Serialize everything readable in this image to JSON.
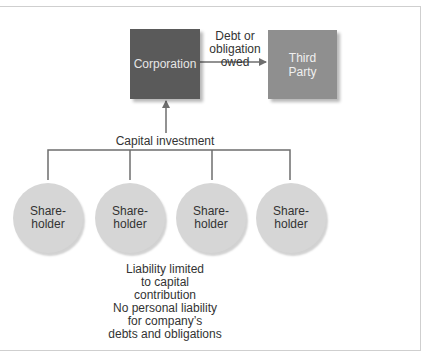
{
  "diagram": {
    "nodes": {
      "corporation": {
        "label": "Corporation",
        "color": "#5a5a5a"
      },
      "third_party": {
        "label": "Third\nParty",
        "line1": "Third",
        "line2": "Party",
        "color": "#8f8f8f"
      },
      "shareholders": [
        {
          "line1": "Share-",
          "line2": "holder"
        },
        {
          "line1": "Share-",
          "line2": "holder"
        },
        {
          "line1": "Share-",
          "line2": "holder"
        },
        {
          "line1": "Share-",
          "line2": "holder"
        }
      ]
    },
    "edges": {
      "debt": {
        "line1": "Debt or",
        "line2": "obligation",
        "line3": "owed",
        "from": "Corporation",
        "to": "Third Party"
      },
      "capital": {
        "label": "Capital investment",
        "from": "Shareholders",
        "to": "Corporation"
      }
    },
    "notes": {
      "liability": {
        "line1": "Liability limited",
        "line2": "to capital",
        "line3": "contribution"
      },
      "personal": {
        "line1": "No personal liability",
        "line2": "for company’s",
        "line3": "debts and obligations"
      }
    },
    "colors": {
      "line": "#6e6e6e",
      "circle": "#d6d6d6",
      "frame": "#cfcfcf"
    }
  }
}
